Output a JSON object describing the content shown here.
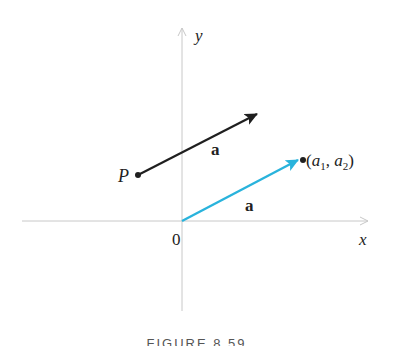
{
  "figure": {
    "caption": "FIGURE 8.59",
    "axes": {
      "x_label": "x",
      "y_label": "y",
      "origin_label": "0",
      "color": "#c8c8c8"
    },
    "vectors": [
      {
        "name": "a",
        "label": "a",
        "start_label": "P",
        "end_label": "",
        "color": "#1f1f1f",
        "description": "vector a with initial point P"
      },
      {
        "name": "a",
        "label": "a",
        "start_label": "0",
        "end_label": "(a1, a2)",
        "color": "#29b3dc",
        "description": "position vector a from origin"
      }
    ],
    "point_label": {
      "open": "(",
      "a1_base": "a",
      "a1_sub": "1",
      "sep": ", ",
      "a2_base": "a",
      "a2_sub": "2",
      "close": ")"
    }
  }
}
